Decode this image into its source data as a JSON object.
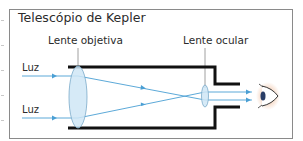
{
  "diagram": {
    "title": "Telescópio de Kepler",
    "labels": {
      "objective_lens": "Lente objetiva",
      "ocular_lens": "Lente ocular",
      "light_top": "Luz",
      "light_bottom": "Luz"
    },
    "colors": {
      "ray": "#4a9fd4",
      "lens_fill": "#cfe6f6",
      "lens_stroke": "#7aa9c9",
      "tube": "#111111",
      "frame": "#8a8a8a",
      "eye_glow": "#e8a070"
    },
    "icons": [
      "lens-objective-icon",
      "lens-ocular-icon",
      "eye-icon",
      "arrow-icon"
    ]
  }
}
